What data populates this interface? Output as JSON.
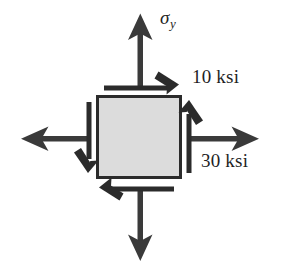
{
  "figure": {
    "name": "stress-element-diagram",
    "background_color": "#ffffff",
    "stroke_color": "#333333",
    "element": {
      "fill_color": "#dcdcdc",
      "border_color": "#2b2b2b",
      "x": 97,
      "y": 96,
      "width": 84,
      "height": 82
    },
    "labels": {
      "sigma_y": {
        "symbol": "σ",
        "subscript": "y"
      },
      "shear_stress": "10 ksi",
      "normal_stress_x": "30 ksi"
    },
    "arrows": {
      "normal_top": {
        "direction": "up",
        "label": "sigma_y"
      },
      "normal_bottom": {
        "direction": "down",
        "label": "sigma_y"
      },
      "normal_left": {
        "direction": "left",
        "label": "30 ksi"
      },
      "normal_right": {
        "direction": "right",
        "label": "30 ksi"
      },
      "shear_top": {
        "direction": "right",
        "label": "10 ksi"
      },
      "shear_bottom": {
        "direction": "left",
        "label": "10 ksi"
      },
      "shear_left": {
        "direction": "down",
        "label": "10 ksi"
      },
      "shear_right": {
        "direction": "up",
        "label": "10 ksi"
      }
    }
  }
}
